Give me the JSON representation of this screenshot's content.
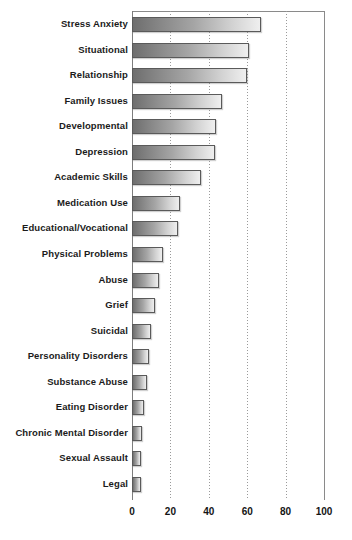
{
  "chart_data": {
    "type": "bar",
    "orientation": "horizontal",
    "title": "",
    "subtitle": "",
    "xlabel": "",
    "ylabel": "",
    "xlim": [
      0,
      100
    ],
    "xticks": [
      0,
      20,
      40,
      60,
      80,
      100
    ],
    "grid": "vertical-dotted",
    "legend": "none",
    "categories": [
      "Stress Anxiety",
      "Situational",
      "Relationship",
      "Family Issues",
      "Developmental",
      "Depression",
      "Academic Skills",
      "Medication Use",
      "Educational/Vocational",
      "Physical Problems",
      "Abuse",
      "Grief",
      "Suicidal",
      "Personality Disorders",
      "Substance Abuse",
      "Eating Disorder",
      "Chronic Mental Disorder",
      "Sexual Assault",
      "Legal"
    ],
    "values": [
      67,
      61,
      60,
      47,
      44,
      43,
      36,
      25,
      24,
      16,
      14,
      12,
      10,
      9,
      8,
      6,
      5,
      4.5,
      4.5
    ],
    "bar_style": {
      "fill_gradient_from": "#6e6e6e",
      "fill_gradient_to": "#efefef",
      "border_color": "#5a5a5a"
    },
    "axis_color": "#7d7d7d",
    "gridline_color": "#9a9a9a",
    "text_color": "#1b1b1b"
  }
}
